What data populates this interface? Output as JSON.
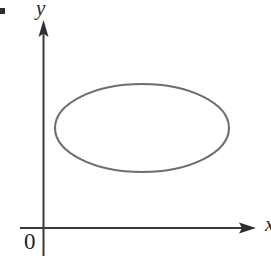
{
  "figure": {
    "kind": "math-coordinate-plot",
    "background_color": "#ffffff",
    "width": 271,
    "height": 256
  },
  "labels": {
    "y_axis": "y",
    "x_axis": "x",
    "origin": "0"
  },
  "colors": {
    "axis": "#3a3a3a",
    "curve": "#6e6e6e",
    "text": "#2b2b2b",
    "background": "#ffffff"
  },
  "chart_data": {
    "type": "line",
    "title": "",
    "subtitle": "",
    "xlabel": "x",
    "ylabel": "y",
    "grid": false,
    "legend": null,
    "annotations": [
      "0"
    ],
    "axes": {
      "origin_px": [
        43,
        228
      ],
      "x_axis": {
        "label": "x",
        "start_px": [
          20,
          228
        ],
        "end_px": [
          256,
          228
        ],
        "arrow": "right",
        "ticks": [],
        "tick_labels": []
      },
      "y_axis": {
        "label": "y",
        "start_px": [
          43,
          256
        ],
        "end_px": [
          43,
          22
        ],
        "arrow": "up",
        "ticks": [],
        "tick_labels": []
      }
    },
    "series": [
      {
        "name": "closed-curve-ellipse",
        "shape": "ellipse",
        "closed": true,
        "filled": false,
        "stroke_color": "#6e6e6e",
        "stroke_width": 2,
        "center_px": [
          142,
          128
        ],
        "radius_x_px": 87,
        "radius_y_px": 44,
        "bounds_px": {
          "left": 55,
          "right": 229,
          "top": 84,
          "bottom": 172
        }
      }
    ]
  }
}
